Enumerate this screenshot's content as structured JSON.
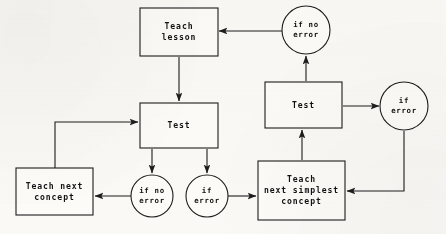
{
  "diagram": {
    "type": "flowchart",
    "nodes": [
      {
        "id": "teach-lesson",
        "shape": "rect",
        "lines": [
          "Teach",
          "lesson"
        ],
        "x": 140,
        "y": 8,
        "w": 78,
        "h": 48
      },
      {
        "id": "if-no-error-top",
        "shape": "circle",
        "lines": [
          "if no",
          "error"
        ],
        "cx": 306,
        "cy": 30,
        "r": 24
      },
      {
        "id": "test-left",
        "shape": "rect",
        "lines": [
          "Test"
        ],
        "x": 140,
        "y": 103,
        "w": 78,
        "h": 45
      },
      {
        "id": "test-right",
        "shape": "rect",
        "lines": [
          "Test"
        ],
        "x": 265,
        "y": 82,
        "w": 77,
        "h": 46
      },
      {
        "id": "if-error-right",
        "shape": "circle",
        "lines": [
          "if",
          "error"
        ],
        "cx": 404,
        "cy": 106,
        "r": 24
      },
      {
        "id": "teach-next-concept",
        "shape": "rect",
        "lines": [
          "Teach next",
          "concept"
        ],
        "x": 16,
        "y": 168,
        "w": 77,
        "h": 47
      },
      {
        "id": "if-no-error-bottom",
        "shape": "circle",
        "lines": [
          "if no",
          "error"
        ],
        "cx": 152,
        "cy": 196,
        "r": 21
      },
      {
        "id": "if-error-bottom",
        "shape": "circle",
        "lines": [
          "if",
          "error"
        ],
        "cx": 207,
        "cy": 196,
        "r": 21
      },
      {
        "id": "teach-next-simplest",
        "shape": "rect",
        "lines": [
          "Teach",
          "next simplest",
          "concept"
        ],
        "x": 258,
        "y": 161,
        "w": 87,
        "h": 59
      }
    ],
    "edges": [
      {
        "id": "edge-ifnoerrortop-to-teachlesson",
        "from": "if-no-error-top",
        "to": "teach-lesson",
        "points": "282,31 219,31",
        "arrow": "end"
      },
      {
        "id": "edge-teachlesson-to-testleft",
        "from": "teach-lesson",
        "to": "test-left",
        "points": "179,57 179,101",
        "arrow": "end"
      },
      {
        "id": "edge-testleft-to-ifnoerrorbottom",
        "from": "test-left",
        "to": "if-no-error-bottom",
        "points": "152,149 152,173",
        "arrow": "end"
      },
      {
        "id": "edge-testleft-to-iferrorbottom",
        "from": "test-left",
        "to": "if-error-bottom",
        "points": "207,149 207,173",
        "arrow": "end"
      },
      {
        "id": "edge-ifnoerrorbottom-to-teachnextconcept",
        "from": "if-no-error-bottom",
        "to": "teach-next-concept",
        "points": "131,196 95,196",
        "arrow": "end"
      },
      {
        "id": "edge-teachnextconcept-to-testleft",
        "from": "teach-next-concept",
        "to": "test-left",
        "points": "55,168 55,122 138,122",
        "arrow": "both"
      },
      {
        "id": "edge-iferrorbottom-to-teachnextsimplest",
        "from": "if-error-bottom",
        "to": "teach-next-simplest",
        "points": "228,196 256,196",
        "arrow": "end"
      },
      {
        "id": "edge-teachnextsimplest-to-testright",
        "from": "teach-next-simplest",
        "to": "test-right",
        "points": "302,160 302,130",
        "arrow": "end"
      },
      {
        "id": "edge-testright-to-ifnoerrortop",
        "from": "test-right",
        "to": "if-no-error-top",
        "points": "306,81 306,56",
        "arrow": "end"
      },
      {
        "id": "edge-testright-to-iferrorright",
        "from": "test-right",
        "to": "if-error-right",
        "points": "343,106 379,106",
        "arrow": "end"
      },
      {
        "id": "edge-iferrorright-to-teachnextsimplest",
        "from": "if-error-right",
        "to": "teach-next-simplest",
        "points": "404,131 404,191 347,191",
        "arrow": "end"
      }
    ]
  }
}
